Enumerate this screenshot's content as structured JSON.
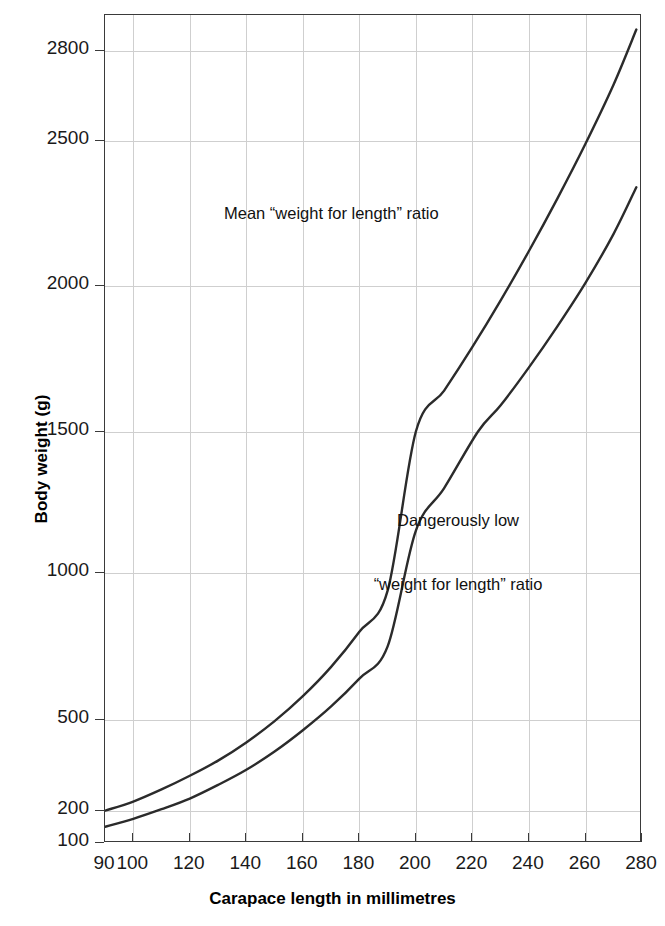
{
  "chart_data": {
    "type": "line",
    "title": "",
    "xlabel": "Carapace length in millimetres",
    "ylabel": "Body weight (g)",
    "xlim": [
      90,
      280
    ],
    "ylim": [
      100,
      2900
    ],
    "grid": true,
    "legend_position": "inline-annotations",
    "xticks": [
      90,
      100,
      120,
      140,
      160,
      180,
      200,
      220,
      240,
      260,
      280
    ],
    "xticklabels": [
      "90",
      "100",
      "120",
      "140",
      "160",
      "180",
      "200",
      "220",
      "240",
      "260",
      "280"
    ],
    "yticks": [
      100,
      200,
      500,
      1000,
      1500,
      2000,
      2500,
      2800
    ],
    "yticklabels": [
      "100",
      "200",
      "500",
      "1000",
      "1500",
      "2000",
      "2500",
      "2800"
    ],
    "series": [
      {
        "name": "Mean “weight for length” ratio",
        "annotation": "Mean “weight for length” ratio",
        "color": "#2b2b2b",
        "x": [
          90,
          100,
          110,
          120,
          130,
          140,
          150,
          160,
          170,
          180,
          190,
          200,
          210,
          220,
          230,
          240,
          250,
          260,
          270,
          278
        ],
        "values": [
          200,
          230,
          270,
          315,
          365,
          425,
          495,
          580,
          680,
          800,
          940,
          1500,
          1640,
          1790,
          1950,
          2120,
          2300,
          2490,
          2690,
          2860
        ]
      },
      {
        "name": "Dangerously low “weight for length” ratio",
        "annotation_line1": "Dangerously low",
        "annotation_line2": "“weight for length” ratio",
        "color": "#2b2b2b",
        "x": [
          90,
          100,
          110,
          120,
          130,
          140,
          150,
          160,
          170,
          180,
          190,
          200,
          210,
          222,
          230,
          240,
          250,
          260,
          270,
          278
        ],
        "values": [
          150,
          175,
          205,
          240,
          285,
          335,
          395,
          465,
          545,
          640,
          750,
          1150,
          1300,
          1500,
          1590,
          1720,
          1860,
          2010,
          2180,
          2340
        ]
      }
    ]
  },
  "axes": {
    "y_title": "Body weight (g)",
    "x_title": "Carapace length in millimetres"
  },
  "annotations": {
    "mean": "Mean “weight for length” ratio",
    "low_line1": "Dangerously low",
    "low_line2": "“weight for length” ratio"
  },
  "colors": {
    "curve": "#2b2b2b",
    "grid": "#cfcfcf",
    "frame": "#3a3a3a",
    "text": "#1a1a1a",
    "background": "#ffffff"
  }
}
